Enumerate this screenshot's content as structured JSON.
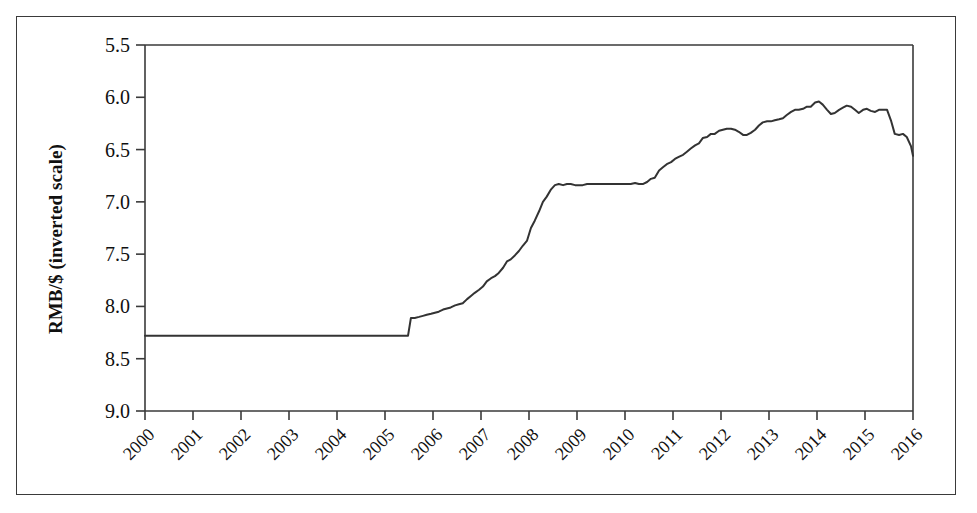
{
  "figure": {
    "kind": "line-chart",
    "frame_color": "#3a3a3a",
    "background": "#ffffff"
  },
  "chart_data": {
    "type": "line",
    "title": "",
    "subtitle": "",
    "xlabel": "",
    "ylabel": "RMB/$ (inverted scale)",
    "ylabel_text": "RMB/$ (inverted scale)",
    "y_inverted": true,
    "ylim": [
      5.5,
      9.0
    ],
    "xlim": [
      2000,
      2016
    ],
    "grid": false,
    "legend": null,
    "legend_position": "none",
    "line_color": "#333333",
    "line_width": 2,
    "y_ticks": [
      5.5,
      6.0,
      6.5,
      7.0,
      7.5,
      8.0,
      8.5,
      9.0
    ],
    "y_tick_labels": [
      "5.5",
      "6.0",
      "6.5",
      "7.0",
      "7.5",
      "8.0",
      "8.5",
      "9.0"
    ],
    "x_ticks": [
      2000,
      2001,
      2002,
      2003,
      2004,
      2005,
      2006,
      2007,
      2008,
      2009,
      2010,
      2011,
      2012,
      2013,
      2014,
      2015,
      2016
    ],
    "x_tick_labels": [
      "2000",
      "2001",
      "2002",
      "2003",
      "2004",
      "2005",
      "2006",
      "2007",
      "2008",
      "2009",
      "2010",
      "2011",
      "2012",
      "2013",
      "2014",
      "2015",
      "2016"
    ],
    "series": [
      {
        "name": "RMB per US dollar",
        "x": [
          2000.0,
          2000.25,
          2000.5,
          2000.75,
          2001.0,
          2001.25,
          2001.5,
          2001.75,
          2002.0,
          2002.25,
          2002.5,
          2002.75,
          2003.0,
          2003.25,
          2003.5,
          2003.75,
          2004.0,
          2004.25,
          2004.5,
          2004.75,
          2005.0,
          2005.25,
          2005.48,
          2005.54,
          2005.62,
          2005.71,
          2005.79,
          2005.87,
          2005.96,
          2006.04,
          2006.12,
          2006.21,
          2006.29,
          2006.37,
          2006.46,
          2006.54,
          2006.62,
          2006.71,
          2006.79,
          2006.87,
          2006.96,
          2007.04,
          2007.12,
          2007.21,
          2007.29,
          2007.37,
          2007.46,
          2007.54,
          2007.62,
          2007.71,
          2007.79,
          2007.87,
          2007.96,
          2008.04,
          2008.12,
          2008.21,
          2008.29,
          2008.37,
          2008.46,
          2008.54,
          2008.62,
          2008.71,
          2008.79,
          2008.87,
          2008.96,
          2009.04,
          2009.12,
          2009.21,
          2009.29,
          2009.37,
          2009.46,
          2009.54,
          2009.62,
          2009.71,
          2009.79,
          2009.87,
          2009.96,
          2010.04,
          2010.12,
          2010.21,
          2010.29,
          2010.37,
          2010.46,
          2010.54,
          2010.62,
          2010.71,
          2010.79,
          2010.87,
          2010.96,
          2011.04,
          2011.12,
          2011.21,
          2011.29,
          2011.37,
          2011.46,
          2011.54,
          2011.62,
          2011.71,
          2011.79,
          2011.87,
          2011.96,
          2012.04,
          2012.12,
          2012.21,
          2012.29,
          2012.37,
          2012.46,
          2012.54,
          2012.62,
          2012.71,
          2012.79,
          2012.87,
          2012.96,
          2013.04,
          2013.12,
          2013.21,
          2013.29,
          2013.37,
          2013.46,
          2013.54,
          2013.62,
          2013.71,
          2013.79,
          2013.87,
          2013.96,
          2014.04,
          2014.12,
          2014.21,
          2014.29,
          2014.37,
          2014.46,
          2014.54,
          2014.62,
          2014.71,
          2014.79,
          2014.87,
          2014.96,
          2015.04,
          2015.12,
          2015.21,
          2015.29,
          2015.37,
          2015.46,
          2015.54,
          2015.62,
          2015.71,
          2015.79,
          2015.87,
          2015.96,
          2016.0
        ],
        "values": [
          8.28,
          8.28,
          8.28,
          8.28,
          8.28,
          8.28,
          8.28,
          8.28,
          8.28,
          8.28,
          8.28,
          8.28,
          8.28,
          8.28,
          8.28,
          8.28,
          8.28,
          8.28,
          8.28,
          8.28,
          8.28,
          8.28,
          8.28,
          8.11,
          8.11,
          8.1,
          8.09,
          8.08,
          8.07,
          8.06,
          8.05,
          8.03,
          8.02,
          8.01,
          7.99,
          7.98,
          7.97,
          7.93,
          7.9,
          7.87,
          7.84,
          7.81,
          7.76,
          7.73,
          7.71,
          7.68,
          7.63,
          7.57,
          7.55,
          7.51,
          7.47,
          7.42,
          7.37,
          7.25,
          7.18,
          7.09,
          7.0,
          6.95,
          6.88,
          6.84,
          6.83,
          6.84,
          6.83,
          6.83,
          6.84,
          6.84,
          6.84,
          6.83,
          6.83,
          6.83,
          6.83,
          6.83,
          6.83,
          6.83,
          6.83,
          6.83,
          6.83,
          6.83,
          6.83,
          6.82,
          6.83,
          6.83,
          6.81,
          6.78,
          6.77,
          6.7,
          6.67,
          6.64,
          6.62,
          6.59,
          6.57,
          6.55,
          6.52,
          6.49,
          6.46,
          6.44,
          6.39,
          6.38,
          6.35,
          6.35,
          6.32,
          6.31,
          6.3,
          6.3,
          6.31,
          6.33,
          6.36,
          6.36,
          6.34,
          6.31,
          6.27,
          6.24,
          6.23,
          6.23,
          6.22,
          6.21,
          6.2,
          6.17,
          6.14,
          6.12,
          6.12,
          6.11,
          6.09,
          6.09,
          6.05,
          6.04,
          6.07,
          6.12,
          6.16,
          6.15,
          6.12,
          6.1,
          6.08,
          6.09,
          6.12,
          6.15,
          6.12,
          6.11,
          6.13,
          6.14,
          6.12,
          6.12,
          6.12,
          6.22,
          6.35,
          6.36,
          6.35,
          6.38,
          6.47,
          6.56
        ]
      }
    ],
    "annotations": []
  },
  "axes": {
    "y_title": "RMB/$ (inverted scale)"
  }
}
